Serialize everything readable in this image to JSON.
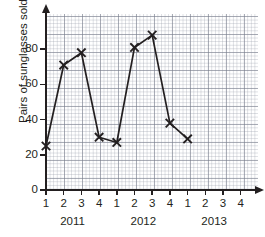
{
  "chart_data": {
    "type": "line",
    "title": "",
    "xlabel": "",
    "ylabel": "Pairs of sunglasses sold",
    "categories": [
      "1",
      "2",
      "3",
      "4",
      "1",
      "2",
      "3",
      "4",
      "1",
      "2",
      "3",
      "4"
    ],
    "group_labels": [
      "2011",
      "2012",
      "2013"
    ],
    "values": [
      25,
      71,
      78,
      30,
      27,
      81,
      88,
      38,
      29,
      null,
      null,
      null
    ],
    "points": [
      {
        "year": "2011",
        "quarter": "1",
        "value": 25
      },
      {
        "year": "2011",
        "quarter": "2",
        "value": 71
      },
      {
        "year": "2011",
        "quarter": "3",
        "value": 78
      },
      {
        "year": "2011",
        "quarter": "4",
        "value": 30
      },
      {
        "year": "2012",
        "quarter": "1",
        "value": 27
      },
      {
        "year": "2012",
        "quarter": "2",
        "value": 81
      },
      {
        "year": "2012",
        "quarter": "3",
        "value": 88
      },
      {
        "year": "2012",
        "quarter": "4",
        "value": 38
      },
      {
        "year": "2013",
        "quarter": "1",
        "value": 29
      }
    ],
    "ylim": [
      0,
      100
    ],
    "yticks": [
      0,
      20,
      40,
      60,
      80
    ],
    "ytick_labels": [
      "0",
      "20",
      "40",
      "60",
      "80"
    ],
    "grid": true,
    "grid_style": "graph-paper",
    "legend": "none",
    "marker": "x",
    "line_color": "#231f20",
    "marker_color": "#231f20",
    "grid_color": "#787d8c",
    "axis_color": "#231f20"
  },
  "axes": {
    "y_title": "Pairs of sunglasses sold"
  }
}
